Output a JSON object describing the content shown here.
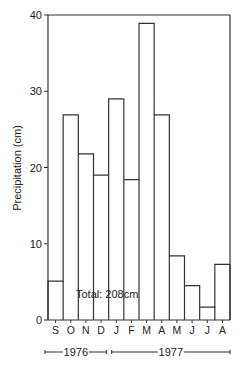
{
  "chart_data": {
    "type": "bar",
    "style": "step-histogram",
    "title": "",
    "xlabel": "",
    "ylabel": "Precipitation (cm)",
    "ylim": [
      0,
      40
    ],
    "yticks": [
      0,
      10,
      20,
      30,
      40
    ],
    "grid": false,
    "categories": [
      "S",
      "O",
      "N",
      "D",
      "J",
      "F",
      "M",
      "A",
      "M",
      "J",
      "J",
      "A"
    ],
    "values": [
      5.1,
      26.9,
      21.8,
      19.0,
      29.0,
      18.4,
      38.9,
      26.9,
      8.4,
      4.5,
      1.7,
      7.3
    ],
    "annotation": "Total: 208cm",
    "year_ranges": [
      {
        "label": "1976",
        "start_index": 0,
        "end_index": 3
      },
      {
        "label": "1977",
        "start_index": 4,
        "end_index": 11
      }
    ]
  },
  "labels": {
    "ylabel": "Precipitation (cm)",
    "annotation": "Total: 208cm",
    "year1": "1976",
    "year2": "1977"
  }
}
